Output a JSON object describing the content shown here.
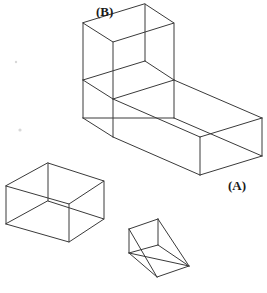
{
  "figure": {
    "background_color": "#ffffff",
    "line_color": "#3a3a3a",
    "label_color": "#1a1a1a",
    "canvas": {
      "width": 267,
      "height": 293
    },
    "labels": [
      {
        "id": "label-b",
        "text": "(B)",
        "x": 96,
        "y": 16,
        "target": "upper-block-top-left-corner"
      },
      {
        "id": "label-a",
        "text": "(A)",
        "x": 228,
        "y": 190,
        "target": "slab-front-right-corner"
      }
    ],
    "solids": [
      {
        "name": "l-shaped-block",
        "type": "composite-wireframe",
        "description": "Large L-shaped solid: horizontal rectangular slab with an upright rectangular block rising from its left end",
        "parts": [
          "lower-slab",
          "upper-block"
        ]
      },
      {
        "name": "small-rectangular-box",
        "type": "rectangular-prism-wireframe",
        "description": "Small wireframe rectangular box at lower left"
      },
      {
        "name": "triangular-wedge",
        "type": "triangular-prism-wireframe",
        "description": "Triangular prism / wedge at bottom center"
      }
    ],
    "geometry": {
      "l_block": {
        "upper_top_face": [
          [
            145,
            4
          ],
          [
            174,
            23
          ],
          [
            113,
            42
          ],
          [
            83,
            23
          ]
        ],
        "upper_height": 57,
        "upper_bottom_face": [
          [
            145,
            61
          ],
          [
            174,
            80
          ],
          [
            113,
            99
          ],
          [
            83,
            80
          ]
        ],
        "slab_top_face": [
          [
            174,
            80
          ],
          [
            262,
            118
          ],
          [
            200,
            137
          ],
          [
            113,
            99
          ]
        ],
        "slab_left_top_face": [
          [
            83,
            80
          ],
          [
            113,
            99
          ],
          [
            113,
            99
          ],
          [
            83,
            80
          ]
        ],
        "slab_thickness": 38,
        "slab_bottom_front": [
          [
            200,
            175
          ],
          [
            262,
            156
          ]
        ],
        "slab_left_front": [
          [
            83,
            118
          ],
          [
            200,
            175
          ]
        ]
      },
      "small_box": {
        "top_face": [
          [
            48,
            163
          ],
          [
            104,
            181
          ],
          [
            69,
            204
          ],
          [
            6,
            186
          ]
        ],
        "height": 38,
        "bottom_face": [
          [
            48,
            201
          ],
          [
            104,
            219
          ],
          [
            69,
            242
          ],
          [
            6,
            224
          ]
        ]
      },
      "wedge": {
        "apex_top": [
          158,
          219
        ],
        "back_top_left": [
          129,
          229
        ],
        "back_bottom_left": [
          129,
          253
        ],
        "front_bottom": [
          157,
          277
        ],
        "right_bottom": [
          189,
          266
        ],
        "right_mid": [
          189,
          266
        ]
      }
    }
  }
}
